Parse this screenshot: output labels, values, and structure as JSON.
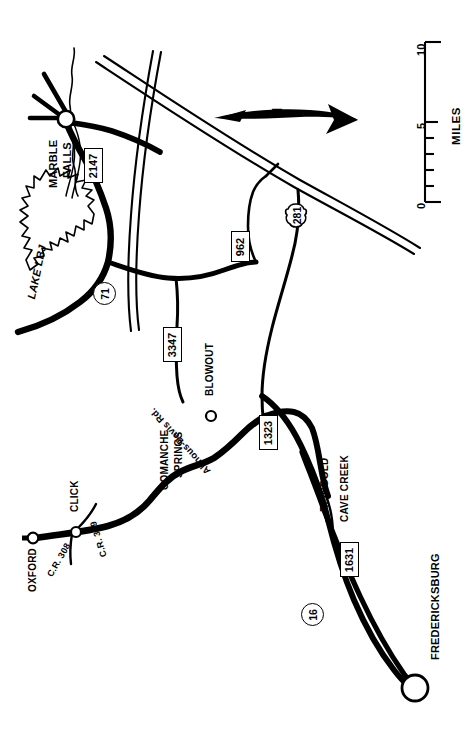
{
  "map": {
    "title": "Texas Hill Country road map (Marble Falls – Fredericksburg)",
    "orientation_note": "Map is rotated 90°; all labels read bottom-to-top",
    "background_color": "#ffffff",
    "ink_color": "#000000",
    "north_arrow": {
      "label": "N",
      "points": "left"
    },
    "scale_bar": {
      "unit_label": "MILES",
      "ticks": [
        "0",
        "5",
        "10"
      ],
      "minor_tick_count": 8,
      "min": 0,
      "max": 10
    },
    "cities": [
      {
        "name": "MARBLE FALLS",
        "lines": [
          "MARBLE",
          "FALLS"
        ],
        "marker": "open-circle"
      },
      {
        "name": "FREDERICKSBURG",
        "lines": [
          "FREDERICKSBURG"
        ],
        "marker": "large-open-circle"
      },
      {
        "name": "OXFORD",
        "lines": [
          "OXFORD"
        ],
        "marker": "open-circle"
      },
      {
        "name": "CLICK",
        "lines": [
          "CLICK"
        ],
        "marker": "open-circle"
      },
      {
        "name": "BLOWOUT",
        "lines": [
          "BLOWOUT"
        ],
        "marker": "open-circle"
      },
      {
        "name": "COMANCHE SPRINGS",
        "lines": [
          "COMANCHE",
          "SPRINGS"
        ],
        "marker": "none"
      },
      {
        "name": "REINGOLD",
        "lines": [
          "REINGOLD"
        ],
        "marker": "none"
      },
      {
        "name": "CAVE CREEK",
        "lines": [
          "CAVE CREEK"
        ],
        "marker": "none"
      }
    ],
    "water": [
      {
        "name": "LAKE LBJ",
        "type": "lake"
      }
    ],
    "local_roads": [
      {
        "name": "C.R. 308"
      },
      {
        "name": "C.R. 309"
      },
      {
        "name": "Althous-Davis Rd."
      }
    ],
    "route_shields": [
      {
        "number": "2147",
        "type": "fm-rectangle"
      },
      {
        "number": "3347",
        "type": "fm-rectangle"
      },
      {
        "number": "962",
        "type": "fm-rectangle"
      },
      {
        "number": "1323",
        "type": "fm-rectangle"
      },
      {
        "number": "1631",
        "type": "fm-rectangle"
      },
      {
        "number": "71",
        "type": "state-circle"
      },
      {
        "number": "16",
        "type": "state-circle"
      },
      {
        "number": "281",
        "type": "us-shield"
      }
    ]
  }
}
